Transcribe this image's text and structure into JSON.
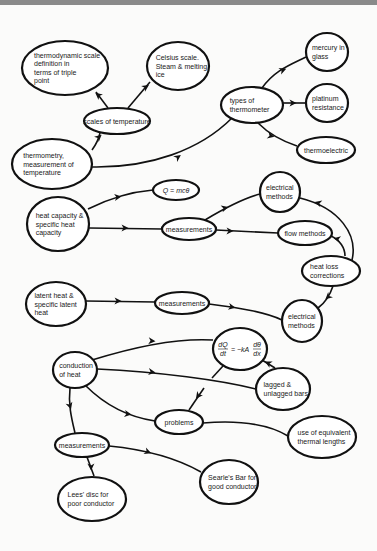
{
  "diagram": {
    "type": "concept-map",
    "colors": {
      "ink": "#111111",
      "paper": "#fbfbfa",
      "topbar": "#8a8a8a"
    },
    "nodes": [
      {
        "id": "thermo_scale",
        "lines": [
          "thermodynamic scale",
          "definition in",
          "terms of triple",
          "point"
        ],
        "cx": 65,
        "cy": 68,
        "rx": 43,
        "ry": 27
      },
      {
        "id": "celsius",
        "lines": [
          "Celsius scale.",
          "Steam & melting",
          "ice"
        ],
        "cx": 178,
        "cy": 66,
        "rx": 31,
        "ry": 24
      },
      {
        "id": "scales",
        "lines": [
          "scales of temperature"
        ],
        "cx": 117,
        "cy": 121,
        "rx": 33,
        "ry": 13
      },
      {
        "id": "thermometry",
        "lines": [
          "thermometry,",
          "measurement of",
          "temperature"
        ],
        "cx": 52,
        "cy": 164,
        "rx": 40,
        "ry": 25
      },
      {
        "id": "types",
        "lines": [
          "types of",
          "thermometer"
        ],
        "cx": 252,
        "cy": 105,
        "rx": 31,
        "ry": 18
      },
      {
        "id": "mercury",
        "lines": [
          "mercury in",
          "glass"
        ],
        "cx": 327,
        "cy": 52,
        "rx": 21,
        "ry": 19
      },
      {
        "id": "platinum",
        "lines": [
          "platinum",
          "resistance"
        ],
        "cx": 327,
        "cy": 103,
        "rx": 21,
        "ry": 19
      },
      {
        "id": "thermoelectric",
        "lines": [
          "thermoelectric"
        ],
        "cx": 326,
        "cy": 150,
        "rx": 29,
        "ry": 13
      },
      {
        "id": "heat_capacity",
        "lines": [
          "heat capacity &",
          "specific heat",
          "capacity"
        ],
        "cx": 58,
        "cy": 224,
        "rx": 31,
        "ry": 27
      },
      {
        "id": "q_mc",
        "lines": [
          "Q = mcθ"
        ],
        "cx": 176,
        "cy": 190,
        "rx": 23,
        "ry": 10,
        "italic": true
      },
      {
        "id": "meas1",
        "lines": [
          "measurements"
        ],
        "cx": 189,
        "cy": 229,
        "rx": 27,
        "ry": 11
      },
      {
        "id": "elec1",
        "lines": [
          "electrical",
          "methods"
        ],
        "cx": 280,
        "cy": 192,
        "rx": 20,
        "ry": 20
      },
      {
        "id": "flow",
        "lines": [
          "flow methods"
        ],
        "cx": 305,
        "cy": 233,
        "rx": 27,
        "ry": 12
      },
      {
        "id": "heat_loss",
        "lines": [
          "heat loss",
          "corrections"
        ],
        "cx": 331,
        "cy": 271,
        "rx": 29,
        "ry": 15
      },
      {
        "id": "latent",
        "lines": [
          "latent heat &",
          "specific latent",
          "heat"
        ],
        "cx": 56,
        "cy": 304,
        "rx": 30,
        "ry": 22
      },
      {
        "id": "meas2",
        "lines": [
          "measurements"
        ],
        "cx": 182,
        "cy": 303,
        "rx": 27,
        "ry": 11
      },
      {
        "id": "elec2",
        "lines": [
          "electrical",
          "methods"
        ],
        "cx": 302,
        "cy": 321,
        "rx": 20,
        "ry": 21
      },
      {
        "id": "fourier",
        "lines": [
          "dQ/dt = −kA dθ/dx"
        ],
        "cx": 240,
        "cy": 349,
        "rx": 27,
        "ry": 21,
        "formula": true
      },
      {
        "id": "conduction",
        "lines": [
          "conduction",
          "of heat"
        ],
        "cx": 75,
        "cy": 370,
        "rx": 22,
        "ry": 18
      },
      {
        "id": "lagged",
        "lines": [
          "lagged &",
          "unlagged bars"
        ],
        "cx": 283,
        "cy": 389,
        "rx": 27,
        "ry": 21
      },
      {
        "id": "problems",
        "lines": [
          "problems"
        ],
        "cx": 179,
        "cy": 422,
        "rx": 24,
        "ry": 12
      },
      {
        "id": "equiv",
        "lines": [
          "use of equivalent",
          "thermal lengths"
        ],
        "cx": 322,
        "cy": 437,
        "rx": 34,
        "ry": 21
      },
      {
        "id": "meas3",
        "lines": [
          "measurements"
        ],
        "cx": 82,
        "cy": 445,
        "rx": 27,
        "ry": 12
      },
      {
        "id": "searle",
        "lines": [
          "Searle's Bar for",
          "good conductor"
        ],
        "cx": 229,
        "cy": 482,
        "rx": 29,
        "ry": 22
      },
      {
        "id": "lees",
        "lines": [
          "Lees' disc for",
          "poor conductor"
        ],
        "cx": 92,
        "cy": 499,
        "rx": 34,
        "ry": 22
      }
    ],
    "edges": [
      {
        "from": "scales",
        "to": "thermo_scale",
        "d": "M108,108 L96,92",
        "arrow": [
          98,
          95
        ]
      },
      {
        "from": "scales",
        "to": "celsius",
        "d": "M128,108 L150,82",
        "arrow": [
          146,
          87
        ]
      },
      {
        "from": "thermometry",
        "to": "scales",
        "d": "M92,150 Q98,142 100,133",
        "arrow": [
          99,
          137
        ]
      },
      {
        "from": "thermometry",
        "to": "types",
        "d": "M92,167 C150,168 200,150 232,118",
        "arrow": [
          178,
          157
        ]
      },
      {
        "from": "types",
        "to": "mercury",
        "d": "M262,88 C275,70 290,65 306,57",
        "arrow": [
          283,
          70
        ]
      },
      {
        "from": "types",
        "to": "platinum",
        "d": "M283,103 L306,103",
        "arrow": [
          293,
          103
        ]
      },
      {
        "from": "types",
        "to": "thermoelectric",
        "d": "M258,123 C270,135 285,142 297,146",
        "arrow": [
          271,
          136
        ]
      },
      {
        "from": "heat_capacity",
        "to": "q_mc",
        "d": "M88,209 C110,198 130,192 153,190",
        "arrow": [
          118,
          197
        ]
      },
      {
        "from": "heat_capacity",
        "to": "meas1",
        "d": "M89,228 L162,229",
        "arrow": [
          125,
          228
        ]
      },
      {
        "from": "meas1",
        "to": "elec1",
        "d": "M205,220 C225,208 245,198 260,194",
        "arrow": [
          225,
          208
        ]
      },
      {
        "from": "meas1",
        "to": "flow",
        "d": "M216,230 L278,233",
        "arrow": [
          230,
          231
        ]
      },
      {
        "from": "heat_loss",
        "to": "elec1",
        "d": "M352,260 C358,235 340,208 300,198",
        "arrow": [
          318,
          203
        ]
      },
      {
        "from": "heat_loss",
        "to": "flow",
        "d": "M345,256 C345,248 340,240 331,236",
        "arrow": [
          337,
          239
        ]
      },
      {
        "from": "heat_loss",
        "to": "elec2",
        "d": "M333,286 C330,295 325,303 318,308",
        "arrow": [
          328,
          297
        ]
      },
      {
        "from": "latent",
        "to": "meas2",
        "d": "M86,301 L155,302",
        "arrow": [
          118,
          301
        ]
      },
      {
        "from": "meas2",
        "to": "elec2",
        "d": "M209,304 C240,308 265,312 282,320",
        "arrow": [
          232,
          307
        ]
      },
      {
        "from": "conduction",
        "to": "fourier",
        "d": "M92,360 C140,345 180,338 213,340",
        "arrow": [
          152,
          341
        ]
      },
      {
        "from": "conduction",
        "to": "lagged",
        "d": "M97,369 C160,372 220,380 256,389",
        "arrow": [
          152,
          372
        ]
      },
      {
        "from": "lagged",
        "to": "fourier",
        "d": "M275,368 L262,360",
        "arrow": [
          268,
          363
        ]
      },
      {
        "from": "fourier",
        "to": "problems",
        "d": "M223,366 L212,378",
        "arrow": []
      },
      {
        "from": "fourier",
        "to": "problems",
        "d": "M204,388 L189,410",
        "arrow": [
          198,
          396
        ]
      },
      {
        "from": "conduction",
        "to": "problems",
        "d": "M86,386 C110,410 135,418 155,421",
        "arrow": [
          128,
          414
        ]
      },
      {
        "from": "problems",
        "to": "equiv",
        "d": "M203,423 C240,420 270,425 288,436",
        "arrow": []
      },
      {
        "from": "conduction",
        "to": "meas3",
        "d": "M70,388 C68,405 72,420 75,433",
        "arrow": [
          70,
          406
        ]
      },
      {
        "from": "meas3",
        "to": "searle",
        "d": "M109,446 C150,450 180,460 201,472",
        "arrow": [
          148,
          452
        ]
      },
      {
        "from": "meas3",
        "to": "lees",
        "d": "M87,457 L94,476",
        "arrow": [
          91,
          467
        ]
      }
    ]
  }
}
